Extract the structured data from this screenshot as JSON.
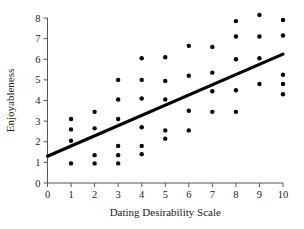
{
  "chart_data": {
    "type": "scatter",
    "title": "",
    "xlabel": "Dating Desirability Scale",
    "ylabel": "Enjoyableness",
    "xlim": [
      0,
      10
    ],
    "ylim": [
      0,
      8
    ],
    "xticks": [
      0,
      1,
      2,
      3,
      4,
      5,
      6,
      7,
      8,
      9,
      10
    ],
    "yticks": [
      0,
      1,
      2,
      3,
      4,
      5,
      6,
      7,
      8
    ],
    "xtick_labels": [
      "0",
      "1",
      "2",
      "3",
      "4",
      "5",
      "6",
      "7",
      "8",
      "9",
      "10"
    ],
    "ytick_labels": [
      "0",
      "1",
      "2",
      "3",
      "4",
      "5",
      "6",
      "7",
      "8"
    ],
    "grid": false,
    "legend": false,
    "point_color": "#000000",
    "point_size": 2.2,
    "points": [
      {
        "x": 1,
        "y": 3.1
      },
      {
        "x": 1,
        "y": 2.6
      },
      {
        "x": 1,
        "y": 2.05
      },
      {
        "x": 1,
        "y": 0.95
      },
      {
        "x": 2,
        "y": 3.45
      },
      {
        "x": 2,
        "y": 2.65
      },
      {
        "x": 2,
        "y": 1.35
      },
      {
        "x": 2,
        "y": 0.95
      },
      {
        "x": 3,
        "y": 5.0
      },
      {
        "x": 3,
        "y": 4.05
      },
      {
        "x": 3,
        "y": 3.1
      },
      {
        "x": 3,
        "y": 1.8
      },
      {
        "x": 3,
        "y": 1.35
      },
      {
        "x": 3,
        "y": 0.95
      },
      {
        "x": 4,
        "y": 6.05
      },
      {
        "x": 4,
        "y": 5.0
      },
      {
        "x": 4,
        "y": 4.1
      },
      {
        "x": 4,
        "y": 2.7
      },
      {
        "x": 4,
        "y": 1.8
      },
      {
        "x": 4,
        "y": 1.4
      },
      {
        "x": 5,
        "y": 6.1
      },
      {
        "x": 5,
        "y": 4.95
      },
      {
        "x": 5,
        "y": 4.05
      },
      {
        "x": 5,
        "y": 2.55
      },
      {
        "x": 5,
        "y": 2.15
      },
      {
        "x": 6,
        "y": 6.65
      },
      {
        "x": 6,
        "y": 5.2
      },
      {
        "x": 6,
        "y": 3.5
      },
      {
        "x": 6,
        "y": 2.55
      },
      {
        "x": 7,
        "y": 6.6
      },
      {
        "x": 7,
        "y": 5.35
      },
      {
        "x": 7,
        "y": 4.45
      },
      {
        "x": 7,
        "y": 3.45
      },
      {
        "x": 8,
        "y": 7.85
      },
      {
        "x": 8,
        "y": 7.1
      },
      {
        "x": 8,
        "y": 6.0
      },
      {
        "x": 8,
        "y": 4.5
      },
      {
        "x": 8,
        "y": 3.45
      },
      {
        "x": 9,
        "y": 8.15
      },
      {
        "x": 9,
        "y": 7.1
      },
      {
        "x": 9,
        "y": 6.05
      },
      {
        "x": 9,
        "y": 4.8
      },
      {
        "x": 10,
        "y": 7.9
      },
      {
        "x": 10,
        "y": 7.15
      },
      {
        "x": 10,
        "y": 5.25
      },
      {
        "x": 10,
        "y": 4.8
      },
      {
        "x": 10,
        "y": 4.3
      }
    ],
    "trend_line": {
      "x0": 0,
      "y0": 1.3,
      "x1": 10,
      "y1": 6.25,
      "color": "#000000",
      "width": 3.2
    }
  }
}
